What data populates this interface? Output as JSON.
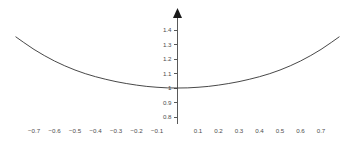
{
  "chart_data": {
    "type": "line",
    "title": "",
    "subtitle": "",
    "xlabel": "",
    "ylabel": "",
    "xlim": [
      -0.8,
      0.8
    ],
    "ylim": [
      0.78,
      1.45
    ],
    "grid": false,
    "legend": null,
    "axis_style": {
      "y_axis_visible": true,
      "y_axis_arrow": true,
      "x_axis_line_visible": false,
      "tick_side": "left",
      "axis_color": "#595959",
      "label_color": "#4d4d4d",
      "curve_color": "#333333",
      "background": "#ffffff"
    },
    "x_ticks": [
      {
        "value": -0.7,
        "label": "−0.7"
      },
      {
        "value": -0.6,
        "label": "−0.6"
      },
      {
        "value": -0.5,
        "label": "−0.5"
      },
      {
        "value": -0.4,
        "label": "−0.4"
      },
      {
        "value": -0.3,
        "label": "−0.3"
      },
      {
        "value": -0.2,
        "label": "−0.2"
      },
      {
        "value": -0.1,
        "label": "−0.1"
      },
      {
        "value": 0.1,
        "label": "0.1"
      },
      {
        "value": 0.2,
        "label": "0.2"
      },
      {
        "value": 0.3,
        "label": "0.3"
      },
      {
        "value": 0.4,
        "label": "0.4"
      },
      {
        "value": 0.5,
        "label": "0.5"
      },
      {
        "value": 0.6,
        "label": "0.6"
      },
      {
        "value": 0.7,
        "label": "0.7"
      }
    ],
    "y_ticks": [
      {
        "value": 0.8,
        "label": "0.8"
      },
      {
        "value": 0.9,
        "label": "0.9"
      },
      {
        "value": 1.0,
        "label": "1"
      },
      {
        "value": 1.1,
        "label": "1.1"
      },
      {
        "value": 1.2,
        "label": "1.2"
      },
      {
        "value": 1.3,
        "label": "1.3"
      },
      {
        "value": 1.4,
        "label": "1.4"
      }
    ],
    "series": [
      {
        "name": "curve",
        "x": [
          -0.79,
          -0.75,
          -0.7,
          -0.65,
          -0.6,
          -0.55,
          -0.5,
          -0.45,
          -0.4,
          -0.35,
          -0.3,
          -0.25,
          -0.2,
          -0.15,
          -0.1,
          -0.05,
          0.0,
          0.05,
          0.1,
          0.15,
          0.2,
          0.25,
          0.3,
          0.35,
          0.4,
          0.45,
          0.5,
          0.55,
          0.6,
          0.65,
          0.7,
          0.75,
          0.79
        ],
        "y": [
          1.354,
          1.314,
          1.266,
          1.224,
          1.186,
          1.153,
          1.124,
          1.099,
          1.078,
          1.06,
          1.044,
          1.031,
          1.02,
          1.011,
          1.005,
          1.001,
          1.0,
          1.001,
          1.005,
          1.011,
          1.02,
          1.031,
          1.044,
          1.06,
          1.078,
          1.099,
          1.124,
          1.153,
          1.186,
          1.224,
          1.266,
          1.314,
          1.354
        ],
        "minimum": {
          "x": 0,
          "y": 1.0
        }
      }
    ]
  }
}
